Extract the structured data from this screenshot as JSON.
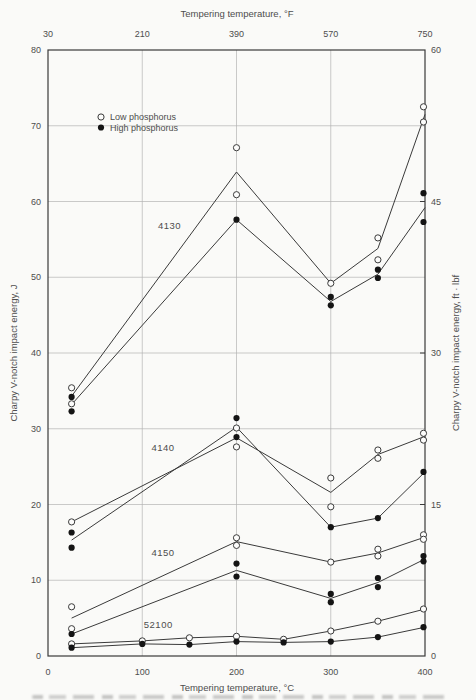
{
  "chart_data": {
    "type": "line",
    "top_axis_label": "Tempering temperature, °F",
    "xlabel": "Tempering temperature, °C",
    "ylabel_left": "Charpy V-notch impact energy, J",
    "ylabel_right": "Charpy V-notch impact energy, ft · lbf",
    "x_ticks_celsius": [
      0,
      100,
      200,
      300,
      400
    ],
    "x_ticks_fahrenheit": [
      30,
      210,
      390,
      570,
      750
    ],
    "y_ticks_joules": [
      0,
      10,
      20,
      30,
      40,
      50,
      60,
      70,
      80
    ],
    "y_ticks_ftlbf": [
      0,
      15,
      30,
      45,
      60
    ],
    "xlim_celsius": [
      0,
      400
    ],
    "ylim_joules": [
      0,
      80
    ],
    "ylim_ftlbf": [
      0,
      60
    ],
    "grid": true,
    "legend": {
      "position": "upper-left-inside",
      "items": [
        {
          "marker": "open",
          "label": "Low phosphorus"
        },
        {
          "marker": "filled",
          "label": "High phosphorus"
        }
      ]
    },
    "colors": {
      "line": "#3a3a3a",
      "frame": "#3a3a3a",
      "grid": "#b3b3b3",
      "text": "#4d4d4d",
      "marker_filled": "#141414",
      "marker_open_fill": "#fcfcfb",
      "background": "#fafaf8"
    },
    "alloys": [
      {
        "name": "4130",
        "label_pos": {
          "c": 129,
          "j": 56.8
        },
        "series": [
          {
            "phosphorus": "low",
            "marker": "open",
            "line": [
              [
                25,
                34.3
              ],
              [
                200,
                63.9
              ],
              [
                300,
                49.2
              ],
              [
                350,
                53.8
              ],
              [
                400,
                71.5
              ]
            ],
            "points": [
              [
                25,
                35.4
              ],
              [
                25,
                33.3
              ],
              [
                200,
                67.1
              ],
              [
                200,
                60.9
              ],
              [
                300,
                49.2
              ],
              [
                350,
                55.2
              ],
              [
                350,
                52.3
              ],
              [
                400,
                72.5
              ],
              [
                400,
                70.5
              ]
            ]
          },
          {
            "phosphorus": "high",
            "marker": "filled",
            "line": [
              [
                25,
                33.2
              ],
              [
                200,
                57.6
              ],
              [
                300,
                46.8
              ],
              [
                350,
                50.4
              ],
              [
                400,
                59.2
              ]
            ],
            "points": [
              [
                25,
                34.2
              ],
              [
                25,
                32.3
              ],
              [
                200,
                57.6
              ],
              [
                300,
                47.4
              ],
              [
                300,
                46.3
              ],
              [
                350,
                51.0
              ],
              [
                350,
                49.9
              ],
              [
                400,
                61.1
              ],
              [
                400,
                57.3
              ]
            ]
          }
        ]
      },
      {
        "name": "4140",
        "label_pos": {
          "c": 122,
          "j": 27.5
        },
        "series": [
          {
            "phosphorus": "low",
            "marker": "open",
            "line": [
              [
                25,
                17.7
              ],
              [
                200,
                28.8
              ],
              [
                300,
                21.6
              ],
              [
                350,
                26.6
              ],
              [
                400,
                29.0
              ]
            ],
            "points": [
              [
                25,
                17.7
              ],
              [
                200,
                30.1
              ],
              [
                200,
                27.6
              ],
              [
                300,
                23.5
              ],
              [
                300,
                19.7
              ],
              [
                350,
                27.2
              ],
              [
                350,
                26.1
              ],
              [
                400,
                29.4
              ],
              [
                400,
                28.5
              ]
            ]
          },
          {
            "phosphorus": "high",
            "marker": "filled",
            "line": [
              [
                25,
                15.3
              ],
              [
                200,
                30.2
              ],
              [
                300,
                17.0
              ],
              [
                350,
                18.2
              ],
              [
                400,
                24.3
              ]
            ],
            "points": [
              [
                25,
                16.3
              ],
              [
                25,
                14.3
              ],
              [
                200,
                31.4
              ],
              [
                200,
                28.9
              ],
              [
                300,
                17.0
              ],
              [
                350,
                18.2
              ],
              [
                400,
                24.3
              ]
            ]
          }
        ]
      },
      {
        "name": "4150",
        "label_pos": {
          "c": 122,
          "j": 13.6
        },
        "series": [
          {
            "phosphorus": "low",
            "marker": "open",
            "line": [
              [
                25,
                5.0
              ],
              [
                200,
                15.1
              ],
              [
                300,
                12.4
              ],
              [
                350,
                13.6
              ],
              [
                400,
                15.7
              ]
            ],
            "points": [
              [
                25,
                6.5
              ],
              [
                25,
                3.6
              ],
              [
                200,
                15.6
              ],
              [
                200,
                14.6
              ],
              [
                300,
                12.4
              ],
              [
                350,
                14.1
              ],
              [
                350,
                13.2
              ],
              [
                400,
                16.0
              ],
              [
                400,
                15.4
              ]
            ]
          },
          {
            "phosphorus": "high",
            "marker": "filled",
            "line": [
              [
                25,
                2.9
              ],
              [
                200,
                11.3
              ],
              [
                300,
                7.6
              ],
              [
                350,
                9.7
              ],
              [
                400,
                12.8
              ]
            ],
            "points": [
              [
                25,
                2.9
              ],
              [
                200,
                12.2
              ],
              [
                200,
                10.5
              ],
              [
                300,
                8.2
              ],
              [
                300,
                7.1
              ],
              [
                350,
                10.3
              ],
              [
                350,
                9.1
              ],
              [
                400,
                13.2
              ],
              [
                400,
                12.5
              ]
            ]
          }
        ]
      },
      {
        "name": "52100",
        "label_pos": {
          "c": 117,
          "j": 4.1
        },
        "series": [
          {
            "phosphorus": "low",
            "marker": "open",
            "line": [
              [
                25,
                1.6
              ],
              [
                100,
                2.0
              ],
              [
                150,
                2.4
              ],
              [
                200,
                2.6
              ],
              [
                250,
                2.2
              ],
              [
                300,
                3.3
              ],
              [
                350,
                4.6
              ],
              [
                400,
                6.2
              ]
            ],
            "points": [
              [
                25,
                1.6
              ],
              [
                100,
                2.0
              ],
              [
                150,
                2.4
              ],
              [
                200,
                2.6
              ],
              [
                250,
                2.2
              ],
              [
                300,
                3.3
              ],
              [
                350,
                4.6
              ],
              [
                400,
                6.2
              ]
            ]
          },
          {
            "phosphorus": "high",
            "marker": "filled",
            "line": [
              [
                25,
                1.1
              ],
              [
                100,
                1.6
              ],
              [
                150,
                1.5
              ],
              [
                200,
                1.9
              ],
              [
                250,
                1.8
              ],
              [
                300,
                1.9
              ],
              [
                350,
                2.5
              ],
              [
                400,
                3.8
              ]
            ],
            "points": [
              [
                25,
                1.1
              ],
              [
                100,
                1.6
              ],
              [
                150,
                1.5
              ],
              [
                200,
                1.9
              ],
              [
                250,
                1.8
              ],
              [
                300,
                1.9
              ],
              [
                350,
                2.5
              ],
              [
                400,
                3.8
              ]
            ]
          }
        ]
      }
    ]
  }
}
